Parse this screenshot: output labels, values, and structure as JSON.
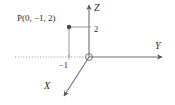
{
  "figure": {
    "kind": "3d-coordinate-axes-diagram",
    "background_color": "#ffffff",
    "stroke_color": "#6f6f6f",
    "text_color": "#2b2b2b",
    "point_color": "#4a4a4a"
  },
  "axes": {
    "x": {
      "label": "X",
      "direction": "down-left",
      "arrow": true
    },
    "y": {
      "label": "Y",
      "direction": "right",
      "arrow": true
    },
    "z": {
      "label": "Z",
      "direction": "up",
      "arrow": true
    }
  },
  "origin": {
    "marker": "open-circle"
  },
  "ticks": [
    {
      "name": "z-tick-2",
      "label": "2",
      "axis": "z",
      "value": 2
    },
    {
      "name": "y-tick-neg1",
      "label": "−1",
      "axis": "y",
      "value": -1
    }
  ],
  "point": {
    "label": "P(0, −1, 2)",
    "coordinates": [
      0,
      -1,
      2
    ],
    "marker": "filled-dot"
  },
  "guides": {
    "negative_y_dotted": true,
    "vertical_drop_from_point": true,
    "horizontal_to_z_axis": true
  }
}
